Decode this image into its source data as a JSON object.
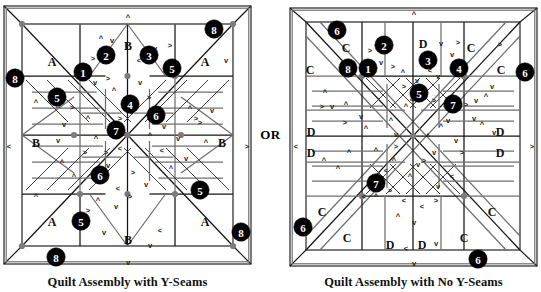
{
  "figure": {
    "connector_label": "OR",
    "background": "#ffffff",
    "ink_color": "#141414",
    "seam_gray": "#6f6f6f",
    "dot_color": "#7c7c7c",
    "badge_fill": "#000000",
    "badge_text_color": "#ffffff"
  },
  "panels": [
    {
      "id": "y-seams",
      "caption": "Quilt Assembly with Y-Seams",
      "patch_labels": [
        {
          "text": "A",
          "x": 52,
          "y": 62
        },
        {
          "text": "B",
          "x": 128,
          "y": 46
        },
        {
          "text": "A",
          "x": 205,
          "y": 62
        },
        {
          "text": "B",
          "x": 36,
          "y": 143
        },
        {
          "text": "B",
          "x": 222,
          "y": 143
        },
        {
          "text": "A",
          "x": 52,
          "y": 222
        },
        {
          "text": "B",
          "x": 128,
          "y": 240
        },
        {
          "text": "A",
          "x": 205,
          "y": 222
        }
      ],
      "badges": [
        {
          "n": "8",
          "x": 15,
          "y": 78
        },
        {
          "n": "8",
          "x": 214,
          "y": 29
        },
        {
          "n": "8",
          "x": 56,
          "y": 257
        },
        {
          "n": "8",
          "x": 241,
          "y": 232
        },
        {
          "n": "1",
          "x": 83,
          "y": 72
        },
        {
          "n": "2",
          "x": 106,
          "y": 55
        },
        {
          "n": "3",
          "x": 149,
          "y": 55
        },
        {
          "n": "4",
          "x": 130,
          "y": 104
        },
        {
          "n": "5",
          "x": 57,
          "y": 97
        },
        {
          "n": "5",
          "x": 172,
          "y": 68
        },
        {
          "n": "5",
          "x": 200,
          "y": 190
        },
        {
          "n": "5",
          "x": 81,
          "y": 221
        },
        {
          "n": "6",
          "x": 156,
          "y": 115
        },
        {
          "n": "6",
          "x": 100,
          "y": 175
        },
        {
          "n": "7",
          "x": 116,
          "y": 130
        }
      ],
      "border_marks": [
        {
          "glyph": "^",
          "x": 128,
          "y": 17
        },
        {
          "glyph": "<",
          "x": 9,
          "y": 146
        },
        {
          "glyph": ">",
          "x": 247,
          "y": 146
        },
        {
          "glyph": "v",
          "x": 128,
          "y": 262
        }
      ]
    },
    {
      "id": "no-y-seams",
      "caption": "Quilt Assembly with No Y-Seams",
      "patch_labels": [
        {
          "text": "C",
          "x": 24,
          "y": 70
        },
        {
          "text": "C",
          "x": 60,
          "y": 48
        },
        {
          "text": "D",
          "x": 101,
          "y": 44
        },
        {
          "text": "D",
          "x": 137,
          "y": 44
        },
        {
          "text": "C",
          "x": 185,
          "y": 48
        },
        {
          "text": "C",
          "x": 215,
          "y": 70
        },
        {
          "text": "D",
          "x": 25,
          "y": 132
        },
        {
          "text": "D",
          "x": 25,
          "y": 153
        },
        {
          "text": "D",
          "x": 214,
          "y": 132
        },
        {
          "text": "D",
          "x": 214,
          "y": 153
        },
        {
          "text": "C",
          "x": 36,
          "y": 212
        },
        {
          "text": "C",
          "x": 61,
          "y": 238
        },
        {
          "text": "D",
          "x": 104,
          "y": 245
        },
        {
          "text": "D",
          "x": 136,
          "y": 245
        },
        {
          "text": "C",
          "x": 178,
          "y": 238
        },
        {
          "text": "C",
          "x": 206,
          "y": 212
        }
      ],
      "badges": [
        {
          "n": "6",
          "x": 51,
          "y": 30
        },
        {
          "n": "6",
          "x": 239,
          "y": 72
        },
        {
          "n": "6",
          "x": 17,
          "y": 227
        },
        {
          "n": "6",
          "x": 192,
          "y": 259
        },
        {
          "n": "8",
          "x": 62,
          "y": 68
        },
        {
          "n": "1",
          "x": 82,
          "y": 68
        },
        {
          "n": "2",
          "x": 98,
          "y": 45
        },
        {
          "n": "3",
          "x": 142,
          "y": 60
        },
        {
          "n": "4",
          "x": 173,
          "y": 68
        },
        {
          "n": "5",
          "x": 133,
          "y": 93
        },
        {
          "n": "7",
          "x": 167,
          "y": 104
        },
        {
          "n": "7",
          "x": 90,
          "y": 183
        }
      ],
      "border_marks": [
        {
          "glyph": "^",
          "x": 128,
          "y": 14
        },
        {
          "glyph": "<",
          "x": 10,
          "y": 146
        },
        {
          "glyph": ">",
          "x": 246,
          "y": 146
        },
        {
          "glyph": "v",
          "x": 128,
          "y": 263
        }
      ]
    }
  ],
  "press_marks": {
    "glyphs": [
      "^",
      "v",
      "<",
      ">"
    ],
    "description": "seam-allowance pressing direction arrows"
  }
}
